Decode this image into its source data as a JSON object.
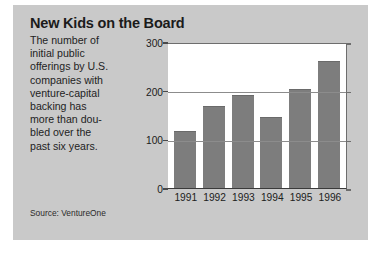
{
  "figure": {
    "title": "New Kids on the Board",
    "blurb_lines": [
      "The number of",
      "initial public",
      "offerings by U.S.",
      "companies with",
      "venture-capital",
      "backing has",
      "more than dou-",
      "bled over the",
      "past six years."
    ],
    "blurb_text": "The number of initial public offerings by U.S. companies with venture-capital backing has more than doubled over the past six years.",
    "source": "Source: VentureOne",
    "panel_color": "#c9c9c9",
    "bar_color": "#7d7d7d",
    "plot_background": "#ffffff"
  },
  "chart_data": {
    "type": "bar",
    "title": "New Kids on the Board",
    "categories": [
      "1991",
      "1992",
      "1993",
      "1994",
      "1995",
      "1996"
    ],
    "values": [
      118,
      168,
      192,
      145,
      203,
      260
    ],
    "xlabel": "",
    "ylabel": "",
    "ylim": [
      0,
      300
    ],
    "yticks": [
      0,
      100,
      200,
      300
    ],
    "ytick_labels": [
      "0",
      "100",
      "200",
      "300"
    ],
    "grid": true,
    "legend": false,
    "series": [
      {
        "name": "Venture-backed IPOs",
        "values": [
          118,
          168,
          192,
          145,
          203,
          260
        ]
      }
    ]
  }
}
